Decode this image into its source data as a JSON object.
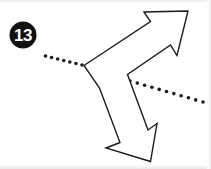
{
  "figure": {
    "badge": {
      "label": "13",
      "shape": "filled-circle",
      "fill_color": "#111111",
      "text_color": "#ffffff",
      "cx": 23,
      "cy": 35,
      "r": 13.5
    },
    "background_color": "#ffffff",
    "stroke_color": "#1a1a1a",
    "stroke_width": 1.4,
    "fill_color": "#ffffff"
  },
  "chart_data": {
    "type": "diagram",
    "title": "",
    "subtitle": "",
    "xlabel": "",
    "ylabel": "",
    "grid": false,
    "legend": null,
    "canvas": {
      "width": 211,
      "height": 169
    },
    "annotations": [
      {
        "name": "item-number",
        "text": "13",
        "x": 23,
        "y": 35
      }
    ],
    "series": [
      {
        "name": "double-headed-zigzag-arrow",
        "type": "outlined-polygon",
        "closed": true,
        "stroke": "#1a1a1a",
        "fill": "#ffffff",
        "points": [
          [
            84.0,
            65.5
          ],
          [
            150.5,
            21.5
          ],
          [
            144.0,
            12.0
          ],
          [
            188.0,
            11.0
          ],
          [
            177.0,
            55.5
          ],
          [
            170.5,
            45.0
          ],
          [
            127.5,
            74.5
          ],
          [
            148.0,
            130.0
          ],
          [
            157.0,
            123.5
          ],
          [
            150.5,
            161.5
          ],
          [
            106.0,
            148.0
          ],
          [
            120.0,
            142.5
          ],
          [
            99.5,
            88.0
          ]
        ]
      },
      {
        "name": "dotted-ray-upper-left",
        "type": "dotted-line",
        "stroke": "#1a1a1a",
        "dot_radius": 1.8,
        "dot_count": 7,
        "from": [
          45.5,
          56.0
        ],
        "to": [
          82.0,
          65.0
        ]
      },
      {
        "name": "dotted-ray-middle",
        "type": "dotted-line",
        "stroke": "#1a1a1a",
        "dot_radius": 1.8,
        "dot_count": 6,
        "from": [
          90.0,
          68.0
        ],
        "to": [
          121.0,
          77.0
        ]
      },
      {
        "name": "dotted-ray-lower-right",
        "type": "dotted-line",
        "stroke": "#1a1a1a",
        "dot_radius": 1.8,
        "dot_count": 11,
        "from": [
          130.0,
          81.0
        ],
        "to": [
          203.0,
          102.0
        ]
      }
    ]
  }
}
